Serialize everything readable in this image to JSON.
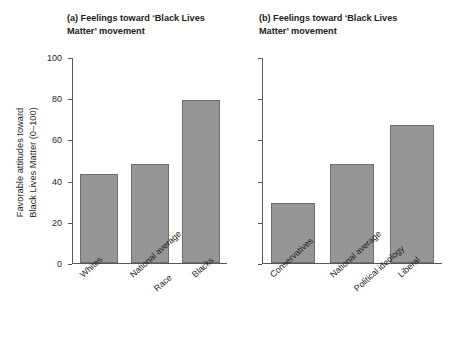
{
  "figure": {
    "background": "#ffffff",
    "bar_fill": "#969696",
    "bar_stroke": "#6e6f71",
    "axis_color": "#58595b",
    "text_color": "#231f20",
    "y_axis_title": "Favorable attitudes toward\nBlack Lives Matter (0–100)"
  },
  "panels": [
    {
      "tag": "(a)",
      "title": " Feelings toward ‘Black Lives Matter’ movement",
      "group_label": "Race",
      "categories": [
        "Whites",
        "National average",
        "Blacks"
      ],
      "values": [
        43,
        48,
        79
      ],
      "tick_labels": [
        "0",
        "20",
        "40",
        "60",
        "80",
        "100"
      ],
      "show_tick_labels": true
    },
    {
      "tag": "(b)",
      "title": " Feelings toward ‘Black Lives Matter’ movement",
      "group_label": "Political ideology",
      "categories": [
        "Conservatives",
        "National average",
        "Liberal"
      ],
      "values": [
        29,
        48,
        67
      ],
      "tick_labels": [
        "0",
        "20",
        "40",
        "60",
        "80",
        "100"
      ],
      "show_tick_labels": false
    }
  ],
  "chart_data": {
    "type": "bar",
    "title": "Feelings toward ‘Black Lives Matter’ movement",
    "xlabel": "",
    "ylabel": "Favorable attitudes toward Black Lives Matter (0–100)",
    "ylim": [
      0,
      100
    ],
    "yticks": [
      0,
      20,
      40,
      60,
      80,
      100
    ],
    "grid": false,
    "legend": "none",
    "panels": [
      {
        "panel": "(a)",
        "title": "Feelings toward ‘Black Lives Matter’ movement",
        "xlabel": "Race",
        "categories": [
          "Whites",
          "National average",
          "Blacks"
        ],
        "values": [
          43,
          48,
          79
        ]
      },
      {
        "panel": "(b)",
        "title": "Feelings toward ‘Black Lives Matter’ movement",
        "xlabel": "Political ideology",
        "categories": [
          "Conservatives",
          "National average",
          "Liberal"
        ],
        "values": [
          29,
          48,
          67
        ]
      }
    ]
  }
}
